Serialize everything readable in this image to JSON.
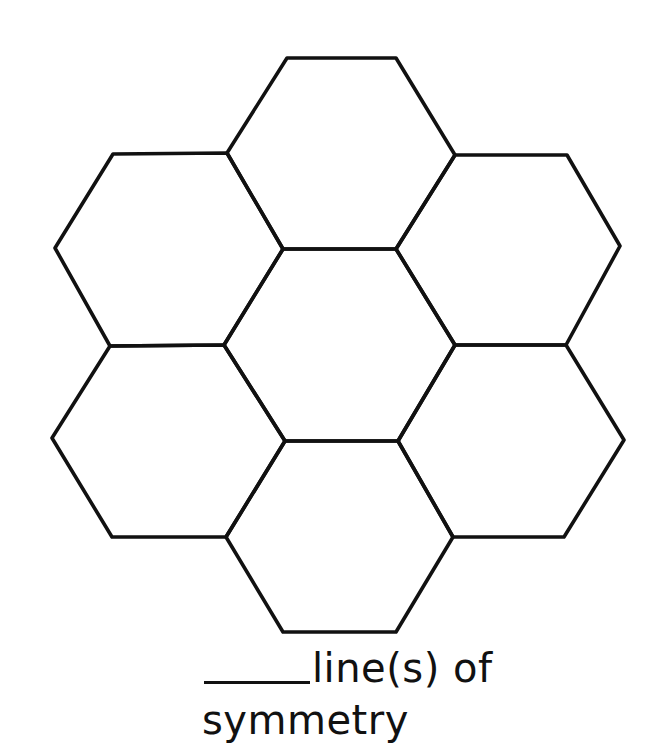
{
  "figure": {
    "stroke_color": "#111111",
    "background": "#ffffff",
    "hexagons": [
      {
        "name": "top",
        "points": "287,58 396,58 455,155 396,249 283,249 227,153"
      },
      {
        "name": "upper-left",
        "points": "113,154 227,153 283,249 224,345 110,346 55,248"
      },
      {
        "name": "upper-right",
        "points": "455,155 567,155 620,246 566,345 455,345 396,249"
      },
      {
        "name": "center",
        "points": "283,249 396,249 455,345 398,441 285,441 224,345"
      },
      {
        "name": "lower-left",
        "points": "110,346 224,345 285,441 226,537 112,537 52,438"
      },
      {
        "name": "lower-right",
        "points": "455,345 566,345 624,440 564,537 453,537 398,441"
      },
      {
        "name": "bottom",
        "points": "285,441 398,441 453,537 396,632 283,632 226,537"
      }
    ]
  },
  "caption": {
    "blank": "______",
    "line1": "line(s) of",
    "line2": "symmetry"
  }
}
